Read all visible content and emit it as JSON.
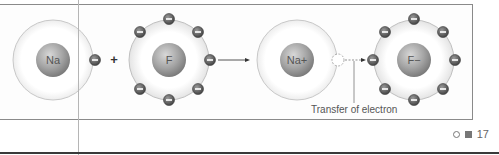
{
  "diagram": {
    "reactants": [
      {
        "symbol": "Na",
        "outer_electrons": 1
      },
      {
        "symbol": "F",
        "outer_electrons": 7
      }
    ],
    "operator_plus": "+",
    "products": [
      {
        "symbol": "Na+",
        "outer_electrons": 0,
        "vacancy": true
      },
      {
        "symbol": "F−",
        "outer_electrons": 8
      }
    ],
    "annotation": "Transfer of electron",
    "electron_sign": "−"
  },
  "footer": {
    "page_number": "17"
  },
  "colors": {
    "frame": "#8a8a8a",
    "nucleus": "#9a9a9a",
    "electron": "#5a5a5a",
    "shell": "#c8c8c8"
  }
}
